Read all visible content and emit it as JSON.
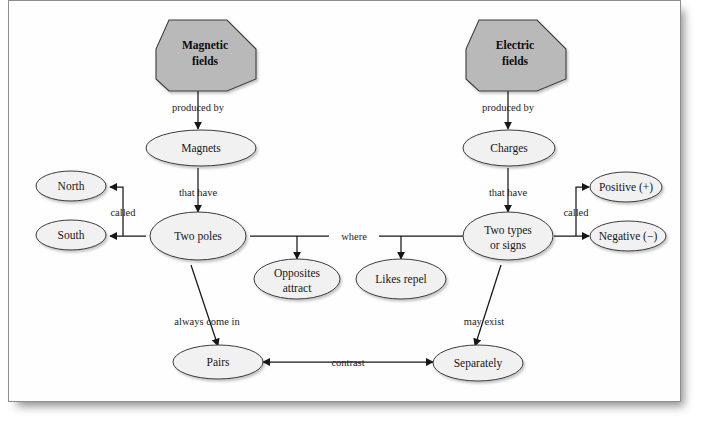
{
  "page": {
    "background_color": "#ffffff",
    "card_color": "#fefefe",
    "card_border_color": "#8d8d8d"
  },
  "style": {
    "root_node_fill": "#b9b9b9",
    "node_fill": "#f1f1f1",
    "node_stroke": "#3a3a3c",
    "edge_color": "#17171a",
    "text_color": "#17171a"
  },
  "diagram": {
    "type": "concept-map",
    "root_nodes": [
      {
        "id": "magnetic-fields",
        "label_line1": "Magnetic",
        "label_line2": "fields",
        "shape": "octagon",
        "cx": 197,
        "cy": 54
      },
      {
        "id": "electric-fields",
        "label_line1": "Electric",
        "label_line2": "fields",
        "shape": "octagon",
        "cx": 507,
        "cy": 54
      }
    ],
    "nodes": [
      {
        "id": "magnets",
        "label": "Magnets",
        "shape": "ellipse",
        "cx": 200,
        "cy": 154,
        "rx": 55,
        "ry": 18
      },
      {
        "id": "charges",
        "label": "Charges",
        "shape": "ellipse",
        "cx": 508,
        "cy": 154,
        "rx": 46,
        "ry": 18
      },
      {
        "id": "north",
        "label": "North",
        "shape": "ellipse",
        "cx": 70,
        "cy": 191,
        "rx": 35,
        "ry": 15
      },
      {
        "id": "south",
        "label": "South",
        "shape": "ellipse",
        "cx": 70,
        "cy": 240,
        "rx": 35,
        "ry": 15
      },
      {
        "id": "two-poles",
        "label": "Two poles",
        "shape": "ellipse",
        "cx": 193,
        "cy": 242,
        "rx": 48,
        "ry": 24
      },
      {
        "id": "two-types-or-signs",
        "label_line1": "Two types",
        "label_line2": "or signs",
        "shape": "ellipse",
        "cx": 507,
        "cy": 242,
        "rx": 45,
        "ry": 24
      },
      {
        "id": "positive",
        "label": "Positive (+)",
        "shape": "ellipse",
        "cx": 625,
        "cy": 192,
        "rx": 36,
        "ry": 15
      },
      {
        "id": "negative",
        "label": "Negative (−)",
        "shape": "ellipse",
        "cx": 627,
        "cy": 241,
        "rx": 38,
        "ry": 15
      },
      {
        "id": "opposites-attract",
        "label_line1": "Opposites",
        "label_line2": "attract",
        "shape": "ellipse",
        "cx": 296,
        "cy": 285,
        "rx": 43,
        "ry": 20
      },
      {
        "id": "likes-repel",
        "label": "Likes repel",
        "shape": "ellipse",
        "cx": 400,
        "cy": 285,
        "rx": 45,
        "ry": 20
      },
      {
        "id": "pairs",
        "label": "Pairs",
        "shape": "ellipse",
        "cx": 217,
        "cy": 368,
        "rx": 45,
        "ry": 17
      },
      {
        "id": "separately",
        "label": "Separately",
        "shape": "ellipse",
        "cx": 477,
        "cy": 369,
        "rx": 45,
        "ry": 18
      }
    ],
    "edges": [
      {
        "id": "e1",
        "from": "magnetic-fields",
        "to": "magnets",
        "label": "produced by",
        "label_x": 197,
        "label_y": 110
      },
      {
        "id": "e2",
        "from": "electric-fields",
        "to": "charges",
        "label": "produced by",
        "label_x": 507,
        "label_y": 110
      },
      {
        "id": "e3",
        "from": "magnets",
        "to": "two-poles",
        "label": "that have",
        "label_x": 193,
        "label_y": 196
      },
      {
        "id": "e4",
        "from": "charges",
        "to": "two-types-or-signs",
        "label": "that have",
        "label_x": 507,
        "label_y": 196
      },
      {
        "id": "e5",
        "from": "two-poles",
        "to": "north",
        "label": "called",
        "label_x": 121,
        "label_y": 216
      },
      {
        "id": "e6",
        "from": "two-poles",
        "to": "south",
        "label": "",
        "label_x": 0,
        "label_y": 0
      },
      {
        "id": "e7",
        "from": "two-types-or-signs",
        "to": "positive",
        "label": "called",
        "label_x": 575,
        "label_y": 216
      },
      {
        "id": "e8",
        "from": "two-types-or-signs",
        "to": "negative",
        "label": "",
        "label_x": 0,
        "label_y": 0
      },
      {
        "id": "e9",
        "from": "two-poles",
        "to": "opposites-attract",
        "label": "where",
        "label_x": 349,
        "label_y": 243
      },
      {
        "id": "e10",
        "from": "two-types-or-signs",
        "to": "likes-repel",
        "label": "",
        "label_x": 0,
        "label_y": 0
      },
      {
        "id": "e11",
        "from": "two-poles",
        "to": "pairs",
        "label": "always come in",
        "label_x": 206,
        "label_y": 325
      },
      {
        "id": "e12",
        "from": "two-types-or-signs",
        "to": "separately",
        "label": "may exist",
        "label_x": 483,
        "label_y": 325
      },
      {
        "id": "e13",
        "from": "separately",
        "to": "pairs",
        "label": "contrast",
        "label_x": 347,
        "label_y": 366
      }
    ],
    "edge_labels": {
      "produced_by": "produced by",
      "that_have": "that have",
      "called": "called",
      "where": "where",
      "always_come_in": "always come in",
      "may_exist": "may exist",
      "contrast": "contrast"
    }
  }
}
